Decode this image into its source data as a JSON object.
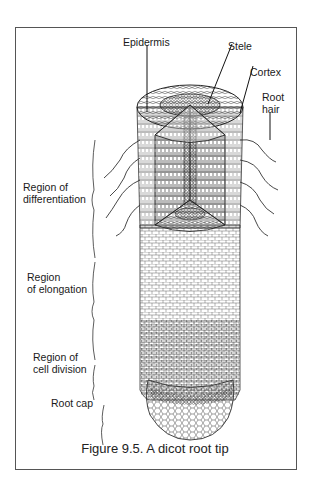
{
  "figure": {
    "caption": "Figure 9.5. A dicot root tip",
    "labels": {
      "epidermis": "Epidermis",
      "stele": "Stele",
      "cortex": "Cortex",
      "root_hair_line1": "Root",
      "root_hair_line2": "hair",
      "differentiation_line1": "Region of",
      "differentiation_line2": "differentiation",
      "elongation_line1": "Region",
      "elongation_line2": "of elongation",
      "cell_division_line1": "Region of",
      "cell_division_line2": "cell division",
      "root_cap": "Root cap"
    }
  }
}
